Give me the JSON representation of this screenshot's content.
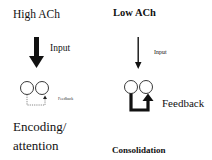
{
  "left_panel": {
    "title": "High ACh",
    "input_label": "Input",
    "feedback_label": "Feedback",
    "caption_line1": "Encoding/",
    "caption_line2": "attention"
  },
  "right_panel": {
    "title": "Low ACh",
    "input_label": "Input",
    "feedback_label": "Feedback",
    "caption": "Consolidation"
  },
  "colors": {
    "ink": "#111111",
    "background": "#ffffff"
  }
}
